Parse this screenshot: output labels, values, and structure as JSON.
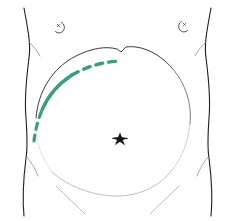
{
  "figure": {
    "background_color": "#ffffff",
    "width": 235,
    "height": 221,
    "has_text_labels": false
  },
  "colors": {
    "outline_dark": "#1d1d1d",
    "outline_mid": "#8f8f94",
    "outline_faint": "#c9c9ce",
    "outline_very_faint": "#dedee2",
    "marker_green": "#3a9e79",
    "navel_black": "#141414",
    "nipple_gray": "#4a4a50"
  },
  "elements": {
    "left_flank": {
      "name": "left torso flank contour",
      "stroke": "#1d1d1d",
      "stroke_width": 1.1,
      "path": "M 24 8 C 28 30, 31 44, 29 58 C 27 74, 24 96, 26 118 C 27 134, 28 146, 26 158 C 24 174, 22 196, 24 216"
    },
    "left_flank_branch_upper": {
      "name": "left upper flank crease",
      "stroke": "#8f8f94",
      "stroke_width": 0.8,
      "path": "M 29 42 C 33 46, 37 50, 40 56"
    },
    "left_flank_branch_lower": {
      "name": "left lower flank crease",
      "stroke": "#8f8f94",
      "stroke_width": 0.8,
      "path": "M 27 157 C 31 162, 35 168, 38 176"
    },
    "right_flank": {
      "name": "right torso flank contour",
      "stroke": "#1d1d1d",
      "stroke_width": 1.1,
      "path": "M 211 8 C 207 30, 204 44, 206 58 C 208 74, 211 96, 209 118 C 208 134, 207 146, 209 158 C 211 174, 213 196, 211 216"
    },
    "right_flank_branch_upper": {
      "name": "right upper flank crease",
      "stroke": "#8f8f94",
      "stroke_width": 0.8,
      "path": "M 206 42 C 202 46, 198 50, 195 56"
    },
    "right_flank_branch_lower": {
      "name": "right lower flank crease",
      "stroke": "#8f8f94",
      "stroke_width": 0.8,
      "path": "M 208 157 C 204 162, 200 168, 197 176"
    },
    "abdomen_arc_top": {
      "name": "upper abdominal / costal margin arc",
      "stroke": "#3a3a40",
      "stroke_width": 1.0,
      "path": "M 36 118 C 38 92, 52 68, 76 56 C 92 48, 106 46, 117 49 L 121 52 L 126 47 C 140 45, 158 52, 172 68"
    },
    "abdomen_arc_top_notch": {
      "name": "xiphoid notch",
      "center_x": 122,
      "center_y": 50
    },
    "abdomen_arc_right": {
      "name": "right abdominal circle arc",
      "stroke": "#6e6e75",
      "stroke_width": 0.9,
      "path": "M 172 68 C 186 84, 192 104, 190 124"
    },
    "abdomen_arc_right_fade": {
      "name": "right abdominal circle arc fading",
      "stroke": "#c9c9ce",
      "stroke_width": 0.9,
      "path": "M 190 124 C 188 142, 182 158, 172 170"
    },
    "abdomen_arc_left_fade": {
      "name": "left abdominal circle arc fading",
      "stroke": "#dedee2",
      "stroke_width": 0.9,
      "path": "M 36 118 C 35 140, 41 158, 52 172"
    },
    "abdomen_arc_bottom": {
      "name": "lower abdominal / pubic arc",
      "stroke": "#b5b5bb",
      "stroke_width": 0.9,
      "path": "M 52 172 C 70 188, 95 196, 117 196 C 140 196, 160 186, 172 170"
    },
    "inguinal_crease_left": {
      "name": "left inguinal crease",
      "stroke": "#b0b0b6",
      "stroke_width": 0.9,
      "path": "M 56 186 C 66 196, 77 206, 85 214"
    },
    "inguinal_crease_right": {
      "name": "right inguinal crease",
      "stroke": "#b0b0b6",
      "stroke_width": 0.9,
      "path": "M 179 186 C 169 196, 158 206, 150 214"
    },
    "navel": {
      "name": "umbilicus star marker",
      "center_x": 120,
      "center_y": 139,
      "radius": 5,
      "color": "#141414"
    },
    "nipple_left": {
      "name": "left nipple mark",
      "center_x": 59,
      "center_y": 27,
      "stroke": "#4a4a50",
      "stroke_width": 1.0
    },
    "nipple_right": {
      "name": "right nipple mark",
      "center_x": 184,
      "center_y": 26,
      "stroke": "#4a4a50",
      "stroke_width": 1.0
    },
    "marker_curve": {
      "name": "green surgical marking / incision line",
      "color": "#3a9e79",
      "stroke_width": 3.2,
      "segments": [
        {
          "part": "distal dashed tail",
          "style": "dashed",
          "dash_pattern": "6 6",
          "path": "M 34 141 C 35 131, 38 120, 42 110"
        },
        {
          "part": "mid solid body",
          "style": "solid",
          "path": "M 42 110 C 48 96, 58 84, 72 75"
        },
        {
          "part": "proximal dashed head",
          "style": "dashed",
          "dash_pattern": "7 6",
          "path": "M 72 75 C 86 67, 101 62, 120 61"
        }
      ],
      "start_point": [
        34,
        141
      ],
      "end_point": [
        120,
        61
      ]
    }
  }
}
